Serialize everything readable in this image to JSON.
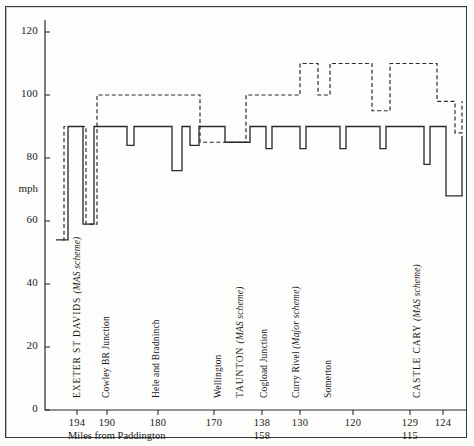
{
  "chart_data": {
    "type": "line",
    "title": "",
    "subtitle": "",
    "xlabel": "Miles from Paddington",
    "ylabel": "mph",
    "ylim": [
      0,
      130
    ],
    "yticks": [
      0,
      20,
      40,
      60,
      80,
      100,
      120
    ],
    "ytick_labels": [
      "0",
      "20",
      "40",
      "60",
      "80",
      "100",
      "120"
    ],
    "grid": false,
    "legend": "none",
    "axis_note": "step profile of line speed along the route; x axis is mileage decreasing left to right",
    "xticks": [
      {
        "label": "194",
        "sub": "",
        "x_px": 77
      },
      {
        "label": "190",
        "sub": "",
        "x_px": 107
      },
      {
        "label": "180",
        "sub": "",
        "x_px": 158
      },
      {
        "label": "170",
        "sub": "",
        "x_px": 214
      },
      {
        "label": "138",
        "sub": "158",
        "x_px": 262
      },
      {
        "label": "130",
        "sub": "",
        "x_px": 300
      },
      {
        "label": "120",
        "sub": "",
        "x_px": 353
      },
      {
        "label": "129",
        "sub": "115",
        "x_px": 410
      },
      {
        "label": "124",
        "sub": "",
        "x_px": 443
      }
    ],
    "stations": [
      {
        "name": "EXETER  ST  DAVIDS ",
        "note": "(MAS scheme)",
        "caps": true,
        "x_px": 72
      },
      {
        "name": "Cowley BR Junction",
        "note": "",
        "caps": false,
        "x_px": 101
      },
      {
        "name": "Hele and Bradninch",
        "note": "",
        "caps": false,
        "x_px": 151
      },
      {
        "name": "Wellington",
        "note": "",
        "caps": false,
        "x_px": 213
      },
      {
        "name": "TAUNTON ",
        "note": "(MAS scheme)",
        "caps": true,
        "x_px": 235
      },
      {
        "name": "Cogload Junction",
        "note": "",
        "caps": false,
        "x_px": 259
      },
      {
        "name": "Curry Rivel ",
        "note": "(Major scheme)",
        "caps": false,
        "x_px": 291
      },
      {
        "name": "Somerton",
        "note": "",
        "caps": false,
        "x_px": 323
      },
      {
        "name": "CASTLE  CARY ",
        "note": "(MAS scheme)",
        "caps": true,
        "x_px": 412
      }
    ],
    "series": [
      {
        "name": "existing permitted speed",
        "style": "solid",
        "color": "#2b2b2b",
        "steps": [
          {
            "x_px": 60,
            "mph": 54
          },
          {
            "x_px": 68,
            "mph": 90
          },
          {
            "x_px": 83,
            "mph": 59
          },
          {
            "x_px": 94,
            "mph": 90
          },
          {
            "x_px": 98,
            "mph": 90
          },
          {
            "x_px": 100,
            "mph": 90
          },
          {
            "x_px": 104,
            "mph": 90
          },
          {
            "x_px": 127,
            "mph": 84
          },
          {
            "x_px": 134,
            "mph": 90
          },
          {
            "x_px": 160,
            "mph": 90
          },
          {
            "x_px": 168,
            "mph": 90
          },
          {
            "x_px": 172,
            "mph": 76
          },
          {
            "x_px": 182,
            "mph": 90
          },
          {
            "x_px": 190,
            "mph": 84
          },
          {
            "x_px": 199,
            "mph": 90
          },
          {
            "x_px": 225,
            "mph": 85
          },
          {
            "x_px": 250,
            "mph": 90
          },
          {
            "x_px": 266,
            "mph": 83
          },
          {
            "x_px": 272,
            "mph": 90
          },
          {
            "x_px": 300,
            "mph": 83
          },
          {
            "x_px": 306,
            "mph": 90
          },
          {
            "x_px": 340,
            "mph": 83
          },
          {
            "x_px": 346,
            "mph": 90
          },
          {
            "x_px": 380,
            "mph": 83
          },
          {
            "x_px": 386,
            "mph": 90
          },
          {
            "x_px": 424,
            "mph": 78
          },
          {
            "x_px": 430,
            "mph": 90
          },
          {
            "x_px": 446,
            "mph": 68
          },
          {
            "x_px": 462,
            "mph": 87
          }
        ]
      },
      {
        "name": "proposed enhanced speed",
        "style": "dashed",
        "color": "#2b2b2b",
        "steps": [
          {
            "x_px": 56,
            "mph": 54
          },
          {
            "x_px": 64,
            "mph": 90
          },
          {
            "x_px": 86,
            "mph": 59
          },
          {
            "x_px": 97,
            "mph": 100
          },
          {
            "x_px": 194,
            "mph": 100
          },
          {
            "x_px": 200,
            "mph": 85
          },
          {
            "x_px": 246,
            "mph": 100
          },
          {
            "x_px": 300,
            "mph": 110
          },
          {
            "x_px": 318,
            "mph": 100
          },
          {
            "x_px": 330,
            "mph": 110
          },
          {
            "x_px": 372,
            "mph": 95
          },
          {
            "x_px": 390,
            "mph": 110
          },
          {
            "x_px": 437,
            "mph": 98
          },
          {
            "x_px": 455,
            "mph": 88
          },
          {
            "x_px": 462,
            "mph": 98
          }
        ]
      }
    ],
    "values_note": "Solid trace = current line speed; dashed trace = speed after resignalling schemes."
  },
  "axis": {
    "y_title": "mph",
    "x_caption": "Miles from Paddington"
  }
}
